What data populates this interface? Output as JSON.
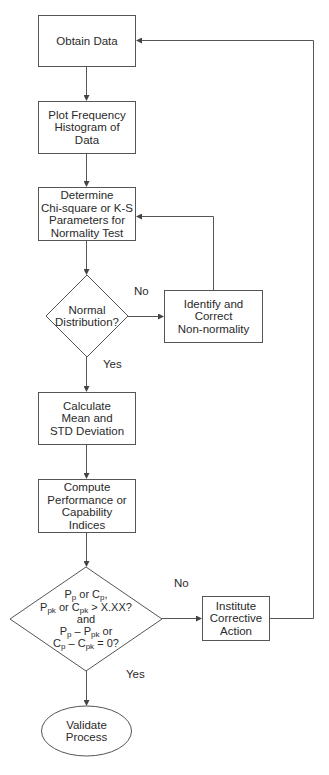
{
  "diagram": {
    "type": "flowchart",
    "colors": {
      "stroke": "#555555",
      "text": "#2a2a2a",
      "background": "#ffffff"
    },
    "nodes": {
      "obtain_data": {
        "shape": "rectangle",
        "lines": [
          "Obtain Data"
        ]
      },
      "plot_histogram": {
        "shape": "rectangle",
        "lines": [
          "Plot Frequency",
          "Histogram of",
          "Data"
        ]
      },
      "determine_params": {
        "shape": "rectangle",
        "lines": [
          "Determine",
          "Chi-square or K-S",
          "Parameters for",
          "Normality Test"
        ]
      },
      "normal_decision": {
        "shape": "diamond",
        "lines": [
          "Normal",
          "Distribution?"
        ]
      },
      "identify_correct": {
        "shape": "rectangle",
        "lines": [
          "Identify and",
          "Correct",
          "Non-normality"
        ]
      },
      "calculate_mean": {
        "shape": "rectangle",
        "lines": [
          "Calculate",
          "Mean and",
          "STD Deviation"
        ]
      },
      "compute_indices": {
        "shape": "rectangle",
        "lines": [
          "Compute",
          "Performance or",
          "Capability",
          "Indices"
        ]
      },
      "capability_decision": {
        "shape": "diamond",
        "lines": [
          "Pp or Cp,",
          "Ppk or Cpk > X.XX?",
          "and",
          "Pp – Ppk or",
          "Cp – Cpk = 0?"
        ]
      },
      "institute_action": {
        "shape": "rectangle",
        "lines": [
          "Institute",
          "Corrective",
          "Action"
        ]
      },
      "validate_process": {
        "shape": "ellipse",
        "lines": [
          "Validate",
          "Process"
        ]
      }
    },
    "edge_labels": {
      "normal_no": "No",
      "normal_yes": "Yes",
      "capability_no": "No",
      "capability_yes": "Yes"
    },
    "edges": [
      {
        "from": "obtain_data",
        "to": "plot_histogram"
      },
      {
        "from": "plot_histogram",
        "to": "determine_params"
      },
      {
        "from": "determine_params",
        "to": "normal_decision"
      },
      {
        "from": "normal_decision",
        "to": "identify_correct",
        "label": "No"
      },
      {
        "from": "identify_correct",
        "to": "determine_params"
      },
      {
        "from": "normal_decision",
        "to": "calculate_mean",
        "label": "Yes"
      },
      {
        "from": "calculate_mean",
        "to": "compute_indices"
      },
      {
        "from": "compute_indices",
        "to": "capability_decision"
      },
      {
        "from": "capability_decision",
        "to": "institute_action",
        "label": "No"
      },
      {
        "from": "institute_action",
        "to": "obtain_data"
      },
      {
        "from": "capability_decision",
        "to": "validate_process",
        "label": "Yes"
      }
    ]
  }
}
